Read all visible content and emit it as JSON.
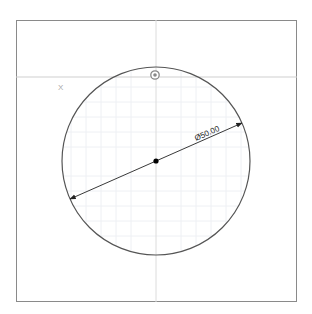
{
  "caption": "",
  "sketch": {
    "colors": {
      "frame": "#8a8a8a",
      "axis": "#cfcfcf",
      "grid": "#eef0f4",
      "circle": "#555555",
      "dimension": "#222222",
      "center_point": "#000000",
      "constraint_icon": "#888888",
      "axis_label": "#aaaaaa"
    },
    "circle": {
      "cx": 156,
      "cy": 161,
      "r": 94
    },
    "dimension": {
      "label": "Ø50.00",
      "angle_deg": -24
    },
    "axis_label": "X",
    "origin_constraint_icon": "coincident-constraint-icon"
  }
}
